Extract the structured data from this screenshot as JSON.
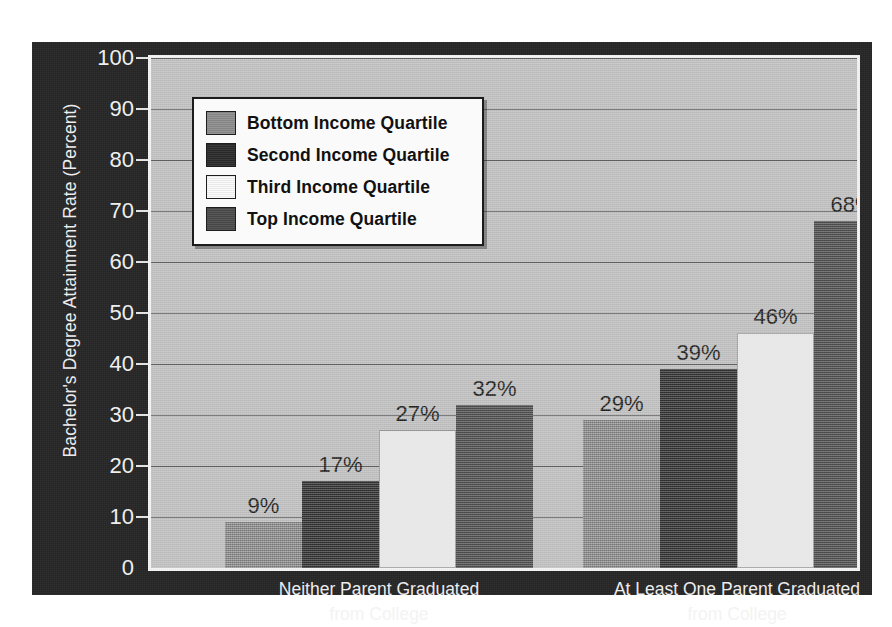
{
  "chart_data": {
    "type": "bar",
    "title": "",
    "xlabel": "",
    "ylabel": "Bachelor's Degree Attainment Rate (Percent)",
    "ylim": [
      0,
      100
    ],
    "ytick_step": 10,
    "yticks": [
      "0",
      "10",
      "20",
      "30",
      "40",
      "50",
      "60",
      "70",
      "80",
      "90",
      "100"
    ],
    "grid": true,
    "legend_position": "top-left",
    "value_suffix": "%",
    "categories": [
      "Neither Parent Graduated from College",
      "At Least One Parent Graduated from College"
    ],
    "category_lines": [
      [
        "Neither Parent Graduated",
        "from College"
      ],
      [
        "At Least One Parent Graduated",
        "from College"
      ]
    ],
    "series": [
      {
        "name": "Bottom Income Quartile",
        "color": "#8e8e8e",
        "values": [
          9,
          29
        ],
        "labels": [
          "9%",
          "29%"
        ]
      },
      {
        "name": "Second Income Quartile",
        "color": "#2b2b2b",
        "values": [
          17,
          39
        ],
        "labels": [
          "17%",
          "39%"
        ]
      },
      {
        "name": "Third Income Quartile",
        "color": "#fbfbfb",
        "values": [
          27,
          46
        ],
        "labels": [
          "27%",
          "46%"
        ]
      },
      {
        "name": "Top Income Quartile",
        "color": "#4b4b4b",
        "values": [
          32,
          68
        ],
        "labels": [
          "32%",
          "68%"
        ]
      }
    ]
  },
  "palette": {
    "frame_background": "#262626",
    "plot_background": "#c5c5c5",
    "gridline": "#5e5e5e",
    "axis_text": "#f3f3f3",
    "value_text": "#1a1a1a",
    "legend_background": "#fafafa",
    "legend_border": "#1c1c1c"
  }
}
